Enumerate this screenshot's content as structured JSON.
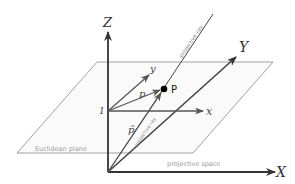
{
  "diagram": {
    "colors": {
      "background": "#ffffff",
      "axis": "#333333",
      "plane_edge": "#8a8a8a",
      "plane_fill": "#fafafa",
      "vector": "#555555",
      "point": "#000000",
      "label_muted": "#9a9a9a"
    },
    "labels": {
      "big_z": "Z",
      "big_x": "X",
      "big_y": "Y",
      "small_x": "x",
      "small_y": "y",
      "one": "1",
      "p_vector": "p",
      "p_tilde": "p̃",
      "point_p": "P",
      "euclidean_plane": "Euclidean plane",
      "projective_space": "projective space",
      "projective_ray_top": "projective ray",
      "projective_ray_low": "projective ray"
    }
  }
}
